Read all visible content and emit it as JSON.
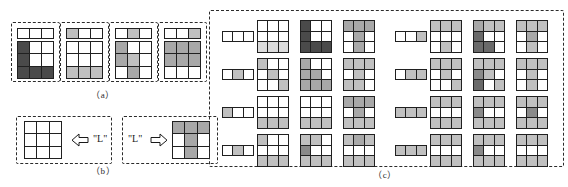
{
  "figure": {
    "caption_a": "（a）",
    "caption_b": "（b）",
    "caption_c": "（c）",
    "label_left_letter": "\"L\"",
    "label_right_letter": "\"L\"",
    "arrow_left_name": "arrow-pointing-left",
    "arrow_right_name": "arrow-pointing-right",
    "shades": {
      "white": "#ffffff",
      "light": "#dcdcdc",
      "light2": "#c0c0c0",
      "mid": "#a8a8a8",
      "mid2": "#8a8a8a",
      "dark": "#6a6a6a",
      "darkest": "#4a4a4a",
      "stroke": "#202020",
      "dash": "#2b2b2b"
    }
  },
  "panel_a": {
    "items": [
      {
        "name": "sample-a-1",
        "strip": [
          0,
          0,
          0
        ],
        "grid": [
          [
            6,
            0,
            0
          ],
          [
            6,
            0,
            0
          ],
          [
            6,
            6,
            6
          ]
        ]
      },
      {
        "name": "sample-a-2",
        "strip": [
          2,
          0,
          0
        ],
        "grid": [
          [
            0,
            0,
            0
          ],
          [
            0,
            0,
            0
          ],
          [
            2,
            2,
            2
          ]
        ]
      },
      {
        "name": "sample-a-3",
        "strip": [
          0,
          2,
          0
        ],
        "grid": [
          [
            3,
            0,
            0
          ],
          [
            3,
            2,
            0
          ],
          [
            0,
            3,
            0
          ]
        ]
      },
      {
        "name": "sample-a-4",
        "strip": [
          0,
          0,
          2
        ],
        "grid": [
          [
            3,
            3,
            3
          ],
          [
            3,
            3,
            3
          ],
          [
            0,
            0,
            0
          ]
        ]
      }
    ]
  },
  "panel_b": {
    "left": {
      "name": "empty-template-grid",
      "grid": [
        [
          0,
          0,
          0
        ],
        [
          0,
          0,
          0
        ],
        [
          0,
          0,
          0
        ]
      ]
    },
    "right": {
      "name": "letter-l-pattern-grid",
      "grid": [
        [
          3,
          3,
          3
        ],
        [
          0,
          3,
          0
        ],
        [
          0,
          3,
          0
        ]
      ]
    }
  },
  "panel_c": {
    "blocks": [
      {
        "name": "block-left",
        "rows": [
          {
            "strip": [
              0,
              0,
              0
            ],
            "grids": [
              [
                [
                  0,
                  0,
                  0
                ],
                [
                  0,
                  0,
                  0
                ],
                [
                  1,
                  1,
                  1
                ]
              ],
              [
                [
                  6,
                  0,
                  0
                ],
                [
                  6,
                  0,
                  0
                ],
                [
                  6,
                  6,
                  6
                ]
              ],
              [
                [
                  3,
                  3,
                  3
                ],
                [
                  0,
                  3,
                  0
                ],
                [
                  0,
                  3,
                  0
                ]
              ]
            ]
          },
          {
            "strip": [
              0,
              2,
              0
            ],
            "grids": [
              [
                [
                  2,
                  0,
                  0
                ],
                [
                  0,
                  2,
                  0
                ],
                [
                  0,
                  0,
                  2
                ]
              ],
              [
                [
                  3,
                  0,
                  0
                ],
                [
                  3,
                  3,
                  0
                ],
                [
                  3,
                  3,
                  3
                ]
              ],
              [
                [
                  2,
                  2,
                  2
                ],
                [
                  0,
                  2,
                  0
                ],
                [
                  2,
                  2,
                  0
                ]
              ]
            ]
          },
          {
            "strip": [
              2,
              0,
              0
            ],
            "grids": [
              [
                [
                  0,
                  0,
                  0
                ],
                [
                  0,
                  0,
                  0
                ],
                [
                  2,
                  2,
                  2
                ]
              ],
              [
                [
                  0,
                  0,
                  0
                ],
                [
                  0,
                  0,
                  0
                ],
                [
                  2,
                  2,
                  2
                ]
              ],
              [
                [
                  3,
                  3,
                  3
                ],
                [
                  0,
                  3,
                  0
                ],
                [
                  2,
                  2,
                  2
                ]
              ]
            ]
          },
          {
            "strip": [
              0,
              2,
              0
            ],
            "grids": [
              [
                [
                  2,
                  0,
                  0
                ],
                [
                  0,
                  0,
                  0
                ],
                [
                  2,
                  2,
                  2
                ]
              ],
              [
                [
                  2,
                  2,
                  0
                ],
                [
                  4,
                  0,
                  0
                ],
                [
                  2,
                  2,
                  2
                ]
              ],
              [
                [
                  2,
                  3,
                  2
                ],
                [
                  0,
                  0,
                  0
                ],
                [
                  2,
                  2,
                  2
                ]
              ]
            ]
          }
        ]
      },
      {
        "name": "block-right",
        "rows": [
          {
            "strip": [
              0,
              0,
              2
            ],
            "grids": [
              [
                [
                  2,
                  2,
                  2
                ],
                [
                  0,
                  0,
                  0
                ],
                [
                  0,
                  2,
                  0
                ]
              ],
              [
                [
                  3,
                  2,
                  2
                ],
                [
                  5,
                  0,
                  0
                ],
                [
                  5,
                  5,
                  0
                ]
              ],
              [
                [
                  2,
                  2,
                  2
                ],
                [
                  0,
                  3,
                  0
                ],
                [
                  0,
                  2,
                  0
                ]
              ]
            ]
          },
          {
            "strip": [
              0,
              2,
              2
            ],
            "grids": [
              [
                [
                  2,
                  2,
                  2
                ],
                [
                  0,
                  2,
                  0
                ],
                [
                  0,
                  0,
                  2
                ]
              ],
              [
                [
                  2,
                  2,
                  2
                ],
                [
                  4,
                  2,
                  0
                ],
                [
                  5,
                  0,
                  2
                ]
              ],
              [
                [
                  2,
                  2,
                  2
                ],
                [
                  0,
                  2,
                  0
                ],
                [
                  0,
                  2,
                  0
                ]
              ]
            ]
          },
          {
            "strip": [
              2,
              2,
              2
            ],
            "grids": [
              [
                [
                  2,
                  2,
                  2
                ],
                [
                  0,
                  0,
                  0
                ],
                [
                  2,
                  2,
                  2
                ]
              ],
              [
                [
                  2,
                  2,
                  2
                ],
                [
                  4,
                  0,
                  0
                ],
                [
                  2,
                  2,
                  2
                ]
              ],
              [
                [
                  2,
                  2,
                  2
                ],
                [
                  0,
                  4,
                  0
                ],
                [
                  2,
                  2,
                  2
                ]
              ]
            ]
          },
          {
            "strip": [
              2,
              2,
              2
            ],
            "grids": [
              [
                [
                  2,
                  2,
                  2
                ],
                [
                  0,
                  0,
                  0
                ],
                [
                  2,
                  2,
                  2
                ]
              ],
              [
                [
                  2,
                  2,
                  2
                ],
                [
                  4,
                  0,
                  0
                ],
                [
                  2,
                  2,
                  2
                ]
              ],
              [
                [
                  2,
                  2,
                  2
                ],
                [
                  0,
                  0,
                  0
                ],
                [
                  2,
                  2,
                  2
                ]
              ]
            ]
          }
        ]
      }
    ]
  }
}
